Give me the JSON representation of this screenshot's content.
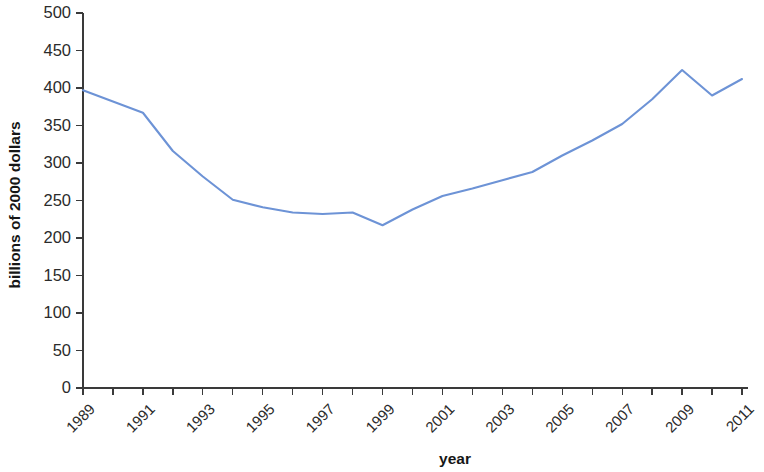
{
  "chart_data": {
    "type": "line",
    "title": "",
    "xlabel": "year",
    "ylabel": "billions of 2000 dollars",
    "xlim": [
      1989,
      2011
    ],
    "ylim": [
      0,
      500
    ],
    "grid": false,
    "legend": null,
    "line_color": "#6d93d6",
    "x": [
      1989,
      1990,
      1991,
      1992,
      1993,
      1994,
      1995,
      1996,
      1997,
      1998,
      1999,
      2000,
      2001,
      2002,
      2003,
      2004,
      2005,
      2006,
      2007,
      2008,
      2009,
      2010,
      2011
    ],
    "values": [
      397,
      382,
      367,
      316,
      282,
      251,
      241,
      234,
      232,
      234,
      217,
      238,
      256,
      266,
      277,
      288,
      310,
      330,
      352,
      385,
      424,
      390,
      412
    ],
    "series": [
      {
        "name": "billions of 2000 dollars",
        "values": [
          397,
          382,
          367,
          316,
          282,
          251,
          241,
          234,
          232,
          234,
          217,
          238,
          256,
          266,
          277,
          288,
          310,
          330,
          352,
          385,
          424,
          390,
          412
        ]
      }
    ],
    "x_tick_labels": [
      "1989",
      "",
      "1991",
      "",
      "1993",
      "",
      "1995",
      "",
      "1997",
      "",
      "1999",
      "",
      "2001",
      "",
      "2003",
      "",
      "2005",
      "",
      "2007",
      "",
      "2009",
      "",
      "2011"
    ],
    "x_tick_values": [
      1989,
      1990,
      1991,
      1992,
      1993,
      1994,
      1995,
      1996,
      1997,
      1998,
      1999,
      2000,
      2001,
      2002,
      2003,
      2004,
      2005,
      2006,
      2007,
      2008,
      2009,
      2010,
      2011
    ],
    "y_tick_labels": [
      "0",
      "50",
      "100",
      "150",
      "200",
      "250",
      "300",
      "350",
      "400",
      "450",
      "500"
    ],
    "y_tick_values": [
      0,
      50,
      100,
      150,
      200,
      250,
      300,
      350,
      400,
      450,
      500
    ]
  }
}
